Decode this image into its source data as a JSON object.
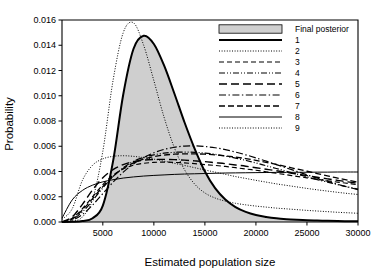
{
  "chart_data": {
    "type": "line",
    "title": "",
    "xlabel": "Estimated population size",
    "ylabel": "Probability",
    "xlim": [
      1000,
      30000
    ],
    "ylim": [
      0.0,
      0.016
    ],
    "xticks": [
      5000,
      10000,
      15000,
      20000,
      25000,
      30000
    ],
    "xticklabels": [
      "5000",
      "10000",
      "15000",
      "20000",
      "25000",
      "30000"
    ],
    "yticks": [
      0.0,
      0.002,
      0.004,
      0.006,
      0.008,
      0.01,
      0.012,
      0.014,
      0.016
    ],
    "yticklabels": [
      "0.000",
      "0.002",
      "0.004",
      "0.006",
      "0.008",
      "0.010",
      "0.012",
      "0.014",
      "0.016"
    ],
    "grid": false,
    "legend_position": "top-right",
    "legend_entries": [
      {
        "label": "Final posterior",
        "style": "filled-swatch"
      },
      {
        "label": "1",
        "style": "solid-thick"
      },
      {
        "label": "2",
        "style": "dotted-fine"
      },
      {
        "label": "3",
        "style": "dashed"
      },
      {
        "label": "4",
        "style": "dash-dot-dot"
      },
      {
        "label": "5",
        "style": "long-dash"
      },
      {
        "label": "6",
        "style": "dash-dot"
      },
      {
        "label": "7",
        "style": "dash-medium"
      },
      {
        "label": "8",
        "style": "solid-thin"
      },
      {
        "label": "9",
        "style": "dotted-fine"
      }
    ],
    "x": [
      1000,
      2000,
      3000,
      4000,
      5000,
      6000,
      7000,
      8000,
      9000,
      10000,
      11000,
      12000,
      13000,
      14000,
      15000,
      16000,
      17000,
      18000,
      19000,
      20000,
      21000,
      22000,
      23000,
      24000,
      25000,
      26000,
      27000,
      28000,
      29000,
      30000
    ],
    "series": [
      {
        "name": "Final posterior",
        "style": "filled-swatch",
        "values": [
          0.0,
          2e-05,
          8e-05,
          0.0003,
          0.0013,
          0.0048,
          0.0101,
          0.0137,
          0.01475,
          0.0141,
          0.0124,
          0.0102,
          0.0079,
          0.0058,
          0.004,
          0.00268,
          0.00178,
          0.00118,
          0.0008,
          0.00055,
          0.0004,
          0.00029,
          0.00022,
          0.00017,
          0.00013,
          0.00011,
          9e-05,
          7e-05,
          6e-05,
          5e-05
        ]
      },
      {
        "name": "1",
        "style": "solid-thick",
        "values": [
          0.0,
          2e-05,
          8e-05,
          0.0003,
          0.0013,
          0.0048,
          0.0101,
          0.0137,
          0.01475,
          0.0141,
          0.0124,
          0.0102,
          0.0079,
          0.0058,
          0.004,
          0.00268,
          0.00178,
          0.00118,
          0.0008,
          0.00055,
          0.0004,
          0.00029,
          0.00022,
          0.00017,
          0.00013,
          0.00011,
          9e-05,
          7e-05,
          6e-05,
          5e-05
        ]
      },
      {
        "name": "2",
        "style": "dotted-fine",
        "values": [
          0.0002,
          0.00105,
          0.0033,
          0.0045,
          0.005,
          0.0052,
          0.00525,
          0.0052,
          0.0051,
          0.00498,
          0.00482,
          0.00465,
          0.00448,
          0.0043,
          0.00412,
          0.00395,
          0.00378,
          0.0036,
          0.00345,
          0.0033,
          0.00316,
          0.00302,
          0.0029,
          0.00278,
          0.00266,
          0.00255,
          0.00245,
          0.00235,
          0.00226,
          0.00218
        ]
      },
      {
        "name": "3",
        "style": "dashed",
        "values": [
          0.0,
          0.0003,
          0.00105,
          0.002,
          0.00295,
          0.0037,
          0.0042,
          0.0045,
          0.00465,
          0.00472,
          0.00474,
          0.00472,
          0.00468,
          0.00462,
          0.00455,
          0.00448,
          0.0044,
          0.0043,
          0.0042,
          0.0041,
          0.00398,
          0.00386,
          0.00374,
          0.00362,
          0.0035,
          0.00338,
          0.00327,
          0.00316,
          0.00306,
          0.00296
        ]
      },
      {
        "name": "4",
        "style": "dash-dot-dot",
        "values": [
          0.0,
          0.0002,
          0.0008,
          0.0017,
          0.0027,
          0.0036,
          0.0043,
          0.0048,
          0.00512,
          0.00532,
          0.00545,
          0.00552,
          0.00554,
          0.00552,
          0.00546,
          0.00536,
          0.00522,
          0.00506,
          0.00488,
          0.00468,
          0.00446,
          0.00424,
          0.00402,
          0.0038,
          0.00358,
          0.00336,
          0.00316,
          0.00296,
          0.00278,
          0.0026
        ]
      },
      {
        "name": "5",
        "style": "long-dash",
        "values": [
          0.0,
          0.0004,
          0.0014,
          0.00255,
          0.0035,
          0.00415,
          0.00455,
          0.00478,
          0.0049,
          0.00495,
          0.00496,
          0.00494,
          0.0049,
          0.00484,
          0.00478,
          0.0047,
          0.00462,
          0.00452,
          0.00442,
          0.0043,
          0.00418,
          0.00406,
          0.00393,
          0.0038,
          0.00367,
          0.00354,
          0.00342,
          0.0033,
          0.00318,
          0.00307
        ]
      },
      {
        "name": "6",
        "style": "dash-dot",
        "values": [
          0.0,
          0.00015,
          0.0006,
          0.00135,
          0.00225,
          0.00315,
          0.00395,
          0.0046,
          0.0051,
          0.00548,
          0.00575,
          0.00592,
          0.00601,
          0.00603,
          0.00598,
          0.00588,
          0.00573,
          0.00554,
          0.00532,
          0.00508,
          0.00482,
          0.00455,
          0.00428,
          0.00401,
          0.00374,
          0.00348,
          0.00323,
          0.00299,
          0.00277,
          0.00256
        ]
      },
      {
        "name": "7",
        "style": "dash-medium",
        "values": [
          0.0,
          0.00025,
          0.00095,
          0.00185,
          0.0028,
          0.00362,
          0.00424,
          0.00468,
          0.00498,
          0.00518,
          0.0053,
          0.00537,
          0.0054,
          0.0054,
          0.00537,
          0.00532,
          0.00524,
          0.00514,
          0.00502,
          0.00488,
          0.00472,
          0.00456,
          0.00438,
          0.0042,
          0.00402,
          0.00384,
          0.00366,
          0.00348,
          0.00331,
          0.00315
        ]
      },
      {
        "name": "8",
        "style": "solid-thin",
        "values": [
          0.0003,
          0.00175,
          0.0025,
          0.00292,
          0.00318,
          0.00335,
          0.00348,
          0.00357,
          0.00364,
          0.00369,
          0.00373,
          0.00377,
          0.0038,
          0.00382,
          0.00384,
          0.00386,
          0.00388,
          0.00389,
          0.0039,
          0.00391,
          0.00392,
          0.00393,
          0.00393,
          0.00394,
          0.00394,
          0.00395,
          0.00395,
          0.00396,
          0.00396,
          0.00396
        ]
      },
      {
        "name": "9",
        "style": "dotted-fine",
        "values": [
          0.0,
          5e-05,
          0.0004,
          0.0018,
          0.0056,
          0.0112,
          0.015,
          0.01578,
          0.014,
          0.0112,
          0.0083,
          0.0059,
          0.00415,
          0.003,
          0.0023,
          0.0019,
          0.00165,
          0.00148,
          0.00136,
          0.00126,
          0.00118,
          0.0011,
          0.00104,
          0.00098,
          0.00092,
          0.00087,
          0.00082,
          0.00077,
          0.00073,
          0.00069
        ]
      }
    ]
  },
  "plot": {
    "left": 62,
    "right": 358,
    "top": 20,
    "bottom": 222
  },
  "colors": {
    "axis": "#000000",
    "shade_fill": "#cfcfcf",
    "text": "#000000"
  }
}
